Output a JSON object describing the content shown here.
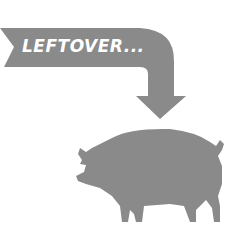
{
  "banner": {
    "text": "LEFTOVER...",
    "color": "#8a8a8a",
    "text_color": "#ffffff"
  },
  "illustration": {
    "arrow": "curved-down-arrow-icon",
    "animal": "pig-icon",
    "color": "#8a8a8a"
  }
}
